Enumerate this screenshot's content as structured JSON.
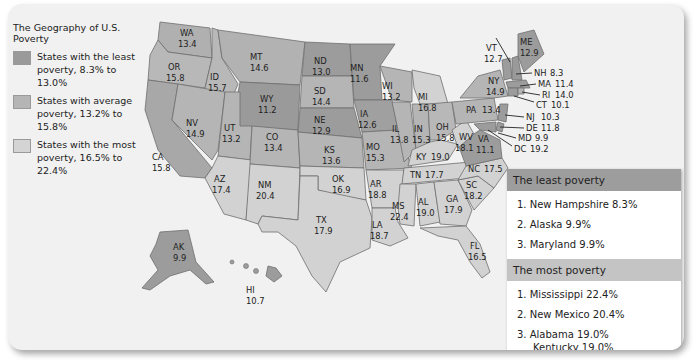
{
  "legend": {
    "title": "The Geography of U.S. Poverty",
    "items": [
      {
        "label": "States with the least poverty, 8.3% to 13.0%",
        "color": "#9a9a9a"
      },
      {
        "label": "States with average poverty, 13.2% to 15.8%",
        "color": "#b5b5b5"
      },
      {
        "label": "States with the most poverty, 16.5% to 22.4%",
        "color": "#d4d4d4"
      }
    ]
  },
  "states": {
    "WA": "13.4",
    "OR": "15.8",
    "CA": "15.8",
    "ID": "15.7",
    "NV": "14.9",
    "MT": "14.6",
    "WY": "11.2",
    "UT": "13.2",
    "AZ": "17.4",
    "CO": "13.4",
    "NM": "20.4",
    "ND": "13.0",
    "SD": "14.4",
    "NE": "12.9",
    "KS": "13.6",
    "OK": "16.9",
    "TX": "17.9",
    "MN": "11.6",
    "IA": "12.6",
    "MO": "15.3",
    "AR": "18.8",
    "LA": "18.7",
    "WI": "13.2",
    "IL": "13.8",
    "MS": "22.4",
    "MI": "16.8",
    "IN": "15.3",
    "KY": "19.0",
    "TN": "17.7",
    "AL": "19.0",
    "OH": "15.8",
    "WV": "18.1",
    "GA": "17.9",
    "FL": "16.5",
    "SC": "18.2",
    "NC": "17.5",
    "VA": "11.1",
    "PA": "13.4",
    "NY": "14.9",
    "VT": "12.7",
    "ME": "12.9",
    "NH": "8.3",
    "MA": "11.4",
    "RI": "14.0",
    "CT": "10.1",
    "NJ": "10.3",
    "DE": "11.8",
    "MD": "9.9",
    "DC": "19.2",
    "AK": "9.9",
    "HI": "10.7"
  },
  "least_poverty": {
    "title": "The least poverty",
    "items": [
      "1. New Hampshire 8.3%",
      "2. Alaska 9.9%",
      "3. Maryland 9.9%"
    ]
  },
  "most_poverty": {
    "title": "The most poverty",
    "items": [
      "1. Mississippi 22.4%",
      "2. New Mexico 20.4%",
      "3. Alabama 19.0%"
    ],
    "tie": "Kentucky 19.0%"
  }
}
